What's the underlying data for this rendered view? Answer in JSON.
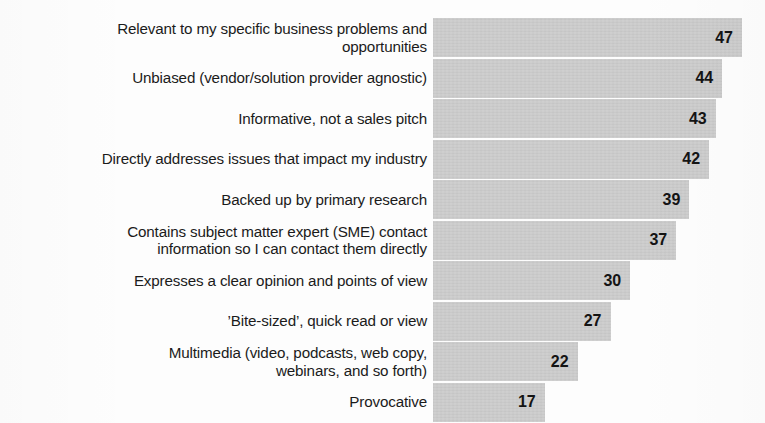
{
  "chart_data": {
    "type": "bar",
    "orientation": "horizontal",
    "title": "",
    "subtitle": "",
    "xlabel": "",
    "ylabel": "",
    "grid": false,
    "legend": null,
    "xlim": [
      0,
      47
    ],
    "value_label_position": "inside-end",
    "categories": [
      "Relevant to my specific business problems and\nopportunities",
      "Unbiased (vendor/solution provider agnostic)",
      "Informative, not a sales pitch",
      "Directly addresses issues that impact my industry",
      "Backed up by primary research",
      "Contains subject matter expert (SME) contact\ninformation so I can contact them directly",
      "Expresses a clear opinion and points of view",
      "’Bite-sized’, quick read or view",
      "Multimedia (video, podcasts, web copy,\nwebinars, and so forth)",
      "Provocative"
    ],
    "values": [
      47,
      44,
      43,
      42,
      39,
      37,
      30,
      27,
      22,
      17
    ],
    "value_labels": [
      "47",
      "44",
      "43",
      "42",
      "39",
      "37",
      "30",
      "27",
      "22",
      "17"
    ],
    "colors": {
      "bar_fill": "#c9c9c9",
      "value_text": "#141414",
      "label_text": "#1b1b1b",
      "background": "#fdfdfd"
    }
  }
}
